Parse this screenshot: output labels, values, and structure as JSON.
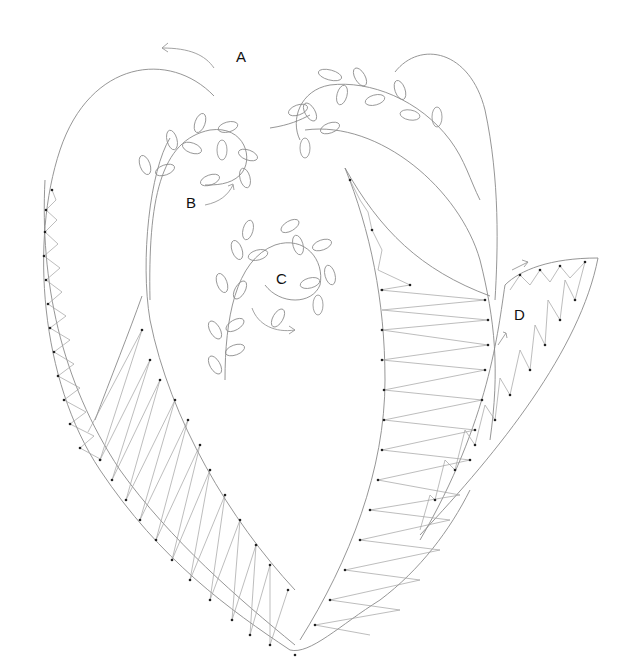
{
  "figure": {
    "labels": [
      {
        "id": "A",
        "text": "A",
        "x": 236,
        "y": 48
      },
      {
        "id": "B",
        "text": "B",
        "x": 186,
        "y": 194
      },
      {
        "id": "C",
        "text": "C",
        "x": 276,
        "y": 272
      },
      {
        "id": "D",
        "text": "D",
        "x": 514,
        "y": 308
      }
    ],
    "colors": {
      "outline": "#8a8a8a",
      "stitch": "#a0a0a0",
      "dot": "#222222",
      "background": "#ffffff"
    }
  }
}
